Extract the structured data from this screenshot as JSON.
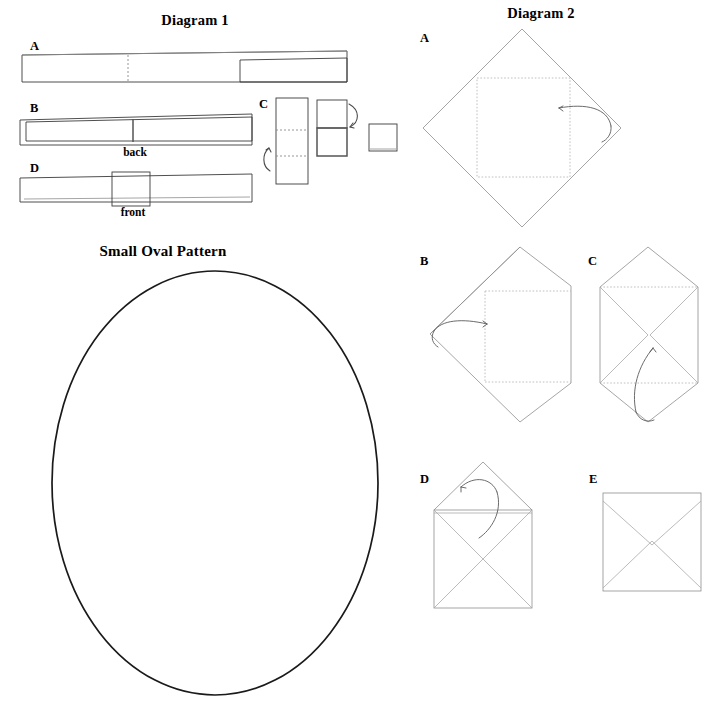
{
  "page": {
    "background": "#ffffff",
    "width": 718,
    "height": 710,
    "line_color": "#3b3b3b",
    "fold_color": "#a9a9a9",
    "oval_color": "#1a1a1a"
  },
  "diagram1": {
    "title": "Diagram 1",
    "steps": [
      {
        "key": "A",
        "label": "A",
        "caption": ""
      },
      {
        "key": "B",
        "label": "B",
        "caption": "back"
      },
      {
        "key": "C",
        "label": "C",
        "caption": ""
      },
      {
        "key": "D",
        "label": "D",
        "caption": "front"
      }
    ],
    "captions": {
      "back": "back",
      "front": "front"
    }
  },
  "diagram2": {
    "title": "Diagram 2",
    "steps": [
      {
        "key": "A",
        "label": "A"
      },
      {
        "key": "B",
        "label": "B"
      },
      {
        "key": "C",
        "label": "C"
      },
      {
        "key": "D",
        "label": "D"
      },
      {
        "key": "E",
        "label": "E"
      }
    ]
  },
  "oval_pattern": {
    "title": "Small Oval Pattern",
    "center_x": 215,
    "center_y": 482,
    "radius_x": 163,
    "radius_y": 212
  }
}
